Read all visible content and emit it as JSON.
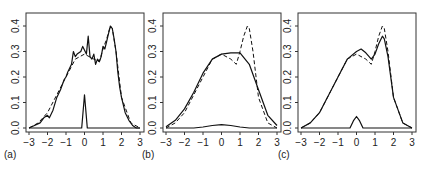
{
  "chart_data": [
    {
      "type": "line",
      "panel_label": "(a)",
      "xlim": [
        -3,
        3
      ],
      "ylim": [
        0,
        0.45
      ],
      "x_ticks": [
        "−3",
        "−2",
        "−1",
        "0",
        "1",
        "2",
        "3"
      ],
      "y_ticks": [
        "0.0",
        "0.1",
        "0.2",
        "0.3",
        "0.4"
      ],
      "series": [
        {
          "name": "true density",
          "style": "dashed",
          "x": [
            -3,
            -2.5,
            -2,
            -1.5,
            -1,
            -0.5,
            0,
            0.5,
            0.8,
            1,
            1.2,
            1.4,
            1.5,
            1.7,
            2,
            2.5,
            3
          ],
          "y": [
            0.0,
            0.02,
            0.06,
            0.13,
            0.2,
            0.27,
            0.29,
            0.27,
            0.26,
            0.31,
            0.35,
            0.4,
            0.39,
            0.3,
            0.12,
            0.02,
            0.0
          ]
        },
        {
          "name": "estimate",
          "style": "solid",
          "x": [
            -3,
            -2.7,
            -2.4,
            -2.2,
            -2.0,
            -1.9,
            -1.7,
            -1.5,
            -1.3,
            -1.1,
            -1.0,
            -0.9,
            -0.7,
            -0.6,
            -0.5,
            -0.4,
            -0.2,
            -0.1,
            0.1,
            0.2,
            0.3,
            0.4,
            0.5,
            0.6,
            0.7,
            0.8,
            0.9,
            1.0,
            1.1,
            1.2,
            1.3,
            1.4,
            1.5,
            1.6,
            1.7,
            1.8,
            1.9,
            2.0,
            2.2,
            2.4,
            2.6,
            2.8,
            3.0
          ],
          "y": [
            0.0,
            0.01,
            0.02,
            0.04,
            0.05,
            0.04,
            0.07,
            0.12,
            0.15,
            0.19,
            0.2,
            0.22,
            0.25,
            0.3,
            0.28,
            0.29,
            0.3,
            0.32,
            0.29,
            0.36,
            0.28,
            0.27,
            0.29,
            0.25,
            0.27,
            0.26,
            0.28,
            0.32,
            0.31,
            0.34,
            0.37,
            0.4,
            0.39,
            0.35,
            0.3,
            0.22,
            0.16,
            0.12,
            0.06,
            0.03,
            0.01,
            0.0,
            0.0
          ]
        },
        {
          "name": "component",
          "style": "solid",
          "x": [
            -3,
            -0.15,
            0,
            0.15,
            3
          ],
          "y": [
            0,
            0,
            0.13,
            0,
            0
          ]
        }
      ]
    },
    {
      "type": "line",
      "panel_label": "(b)",
      "xlim": [
        -3,
        3
      ],
      "ylim": [
        0,
        0.45
      ],
      "x_ticks": [
        "−3",
        "−2",
        "−1",
        "0",
        "1",
        "2",
        "3"
      ],
      "y_ticks": [
        "0.0",
        "0.1",
        "0.2",
        "0.3",
        "0.4"
      ],
      "series": [
        {
          "name": "true density",
          "style": "dashed",
          "x": [
            -3,
            -2.5,
            -2,
            -1.5,
            -1,
            -0.5,
            0,
            0.5,
            0.8,
            1,
            1.2,
            1.4,
            1.5,
            1.7,
            2,
            2.5,
            3
          ],
          "y": [
            0.0,
            0.02,
            0.06,
            0.13,
            0.2,
            0.27,
            0.29,
            0.27,
            0.25,
            0.3,
            0.36,
            0.4,
            0.39,
            0.3,
            0.12,
            0.02,
            0.0
          ]
        },
        {
          "name": "estimate",
          "style": "solid",
          "x": [
            -3,
            -2.5,
            -2,
            -1.5,
            -1,
            -0.5,
            0,
            0.5,
            1,
            1.5,
            2,
            2.5,
            3
          ],
          "y": [
            0.005,
            0.03,
            0.075,
            0.14,
            0.215,
            0.27,
            0.29,
            0.295,
            0.295,
            0.25,
            0.15,
            0.05,
            0.01
          ]
        },
        {
          "name": "component",
          "style": "solid",
          "x": [
            -3,
            -1.5,
            -1,
            -0.5,
            0,
            0.5,
            1,
            1.5,
            3
          ],
          "y": [
            0,
            0,
            0.004,
            0.01,
            0.013,
            0.01,
            0.004,
            0,
            0
          ]
        }
      ]
    },
    {
      "type": "line",
      "panel_label": "(c)",
      "xlim": [
        -3,
        3
      ],
      "ylim": [
        0,
        0.45
      ],
      "x_ticks": [
        "−3",
        "−2",
        "−1",
        "0",
        "1",
        "2",
        "3"
      ],
      "y_ticks": [
        "0.0",
        "0.1",
        "0.2",
        "0.3",
        "0.4"
      ],
      "series": [
        {
          "name": "true density",
          "style": "dashed",
          "x": [
            -3,
            -2.5,
            -2,
            -1.5,
            -1,
            -0.5,
            0,
            0.5,
            0.8,
            1,
            1.2,
            1.4,
            1.5,
            1.7,
            2,
            2.5,
            3
          ],
          "y": [
            0.0,
            0.02,
            0.06,
            0.13,
            0.2,
            0.27,
            0.29,
            0.27,
            0.25,
            0.3,
            0.36,
            0.4,
            0.39,
            0.3,
            0.12,
            0.02,
            0.0
          ]
        },
        {
          "name": "estimate",
          "style": "solid",
          "x": [
            -3,
            -2.5,
            -2,
            -1.5,
            -1,
            -0.5,
            0,
            0.25,
            0.5,
            0.8,
            1,
            1.2,
            1.4,
            1.5,
            1.7,
            2,
            2.5,
            3
          ],
          "y": [
            0.0,
            0.02,
            0.06,
            0.13,
            0.2,
            0.27,
            0.3,
            0.31,
            0.295,
            0.27,
            0.29,
            0.33,
            0.36,
            0.35,
            0.28,
            0.12,
            0.02,
            0.0
          ]
        },
        {
          "name": "component",
          "style": "solid",
          "x": [
            -3,
            -0.35,
            -0.15,
            0,
            0.15,
            0.35,
            3
          ],
          "y": [
            0,
            0,
            0.03,
            0.045,
            0.03,
            0,
            0
          ]
        }
      ]
    }
  ],
  "panels": [
    {
      "label": "(a)"
    },
    {
      "label": "(b)"
    },
    {
      "label": "(c)"
    }
  ]
}
